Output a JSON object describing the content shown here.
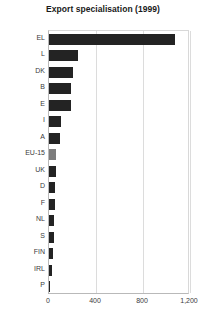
{
  "chart_data": {
    "type": "bar",
    "orientation": "horizontal",
    "title": "Export specialisation (1999)",
    "xlabel": "",
    "ylabel": "",
    "xlim": [
      0,
      1200
    ],
    "ylim": null,
    "grid": true,
    "legend": null,
    "xticks": [
      "0",
      "400",
      "800",
      "1,200"
    ],
    "xtick_values": [
      0,
      400,
      800,
      1200
    ],
    "categories": [
      "EL",
      "L",
      "DK",
      "B",
      "E",
      "I",
      "A",
      "EU-15",
      "UK",
      "D",
      "F",
      "NL",
      "S",
      "FIN",
      "IRL",
      "P"
    ],
    "values": [
      1075,
      250,
      200,
      190,
      185,
      105,
      95,
      62,
      60,
      55,
      50,
      45,
      40,
      32,
      22,
      12
    ],
    "series": [
      {
        "name": "Export specialisation",
        "values": [
          1075,
          250,
          200,
          190,
          185,
          105,
          95,
          62,
          60,
          55,
          50,
          45,
          40,
          32,
          22,
          12
        ]
      }
    ],
    "highlight_category": "EU-15",
    "colors": {
      "bar": "#232323",
      "bar_highlight": "#7d7d7d",
      "grid": "#dcdcdc",
      "axis": "#b9b9b9",
      "text": "#3b3b3b",
      "title": "#1a1a1a",
      "background": "#ffffff"
    }
  }
}
